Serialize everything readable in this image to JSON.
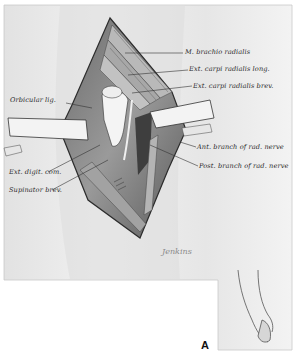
{
  "figure": {
    "letter": "A",
    "signature": "Jenkins",
    "colors": {
      "background": "#ffffff",
      "plate": "#ebebeb",
      "muscle_dark": "#4a4a4a",
      "muscle_mid": "#8c8c8c",
      "line": "#333333"
    }
  },
  "labels": {
    "right": [
      {
        "text": "M. brachio radialis"
      },
      {
        "text": "Ext. carpi radialis long."
      },
      {
        "text": "Ext. carpi radialis brev."
      },
      {
        "text": "Ant. branch of rad. nerve"
      },
      {
        "text": "Post. branch of rad. nerve"
      }
    ],
    "left": [
      {
        "text": "Orbicular lig."
      },
      {
        "text": "Ext. digit. com."
      },
      {
        "text": "Supinator brev."
      }
    ]
  }
}
